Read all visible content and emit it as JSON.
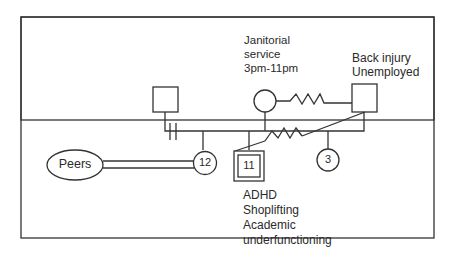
{
  "diagram": {
    "type": "genogram",
    "nodes": {
      "paternal_grandfather": {
        "shape": "square",
        "label": ""
      },
      "mother": {
        "shape": "circle",
        "label": "",
        "note_lines": [
          "Janitorial",
          "service",
          "3pm-11pm"
        ]
      },
      "father": {
        "shape": "square",
        "label": "",
        "note_lines": [
          "Back injury",
          "Unemployed"
        ]
      },
      "sibling_12": {
        "shape": "circle",
        "label": "12"
      },
      "index_child_11": {
        "shape": "double-square",
        "label": "11",
        "note_lines": [
          "ADHD",
          "Shoplifting",
          "Academic",
          "underfunctioning"
        ]
      },
      "sibling_3": {
        "shape": "circle",
        "label": "3"
      },
      "peers": {
        "shape": "ellipse",
        "label": "Peers"
      }
    },
    "relationships": [
      {
        "from": "mother",
        "to": "father",
        "type": "conflictual (zigzag)"
      },
      {
        "from": "father",
        "to": "index_child_11",
        "type": "conflictual (zigzag)"
      },
      {
        "from": "sibling_12",
        "to": "peers",
        "type": "strong (double line)"
      },
      {
        "from": "paternal_grandfather",
        "to": "family",
        "type": "cutoff (double hash)"
      }
    ],
    "colors": {
      "line": "#333333",
      "background": "#ffffff"
    }
  }
}
